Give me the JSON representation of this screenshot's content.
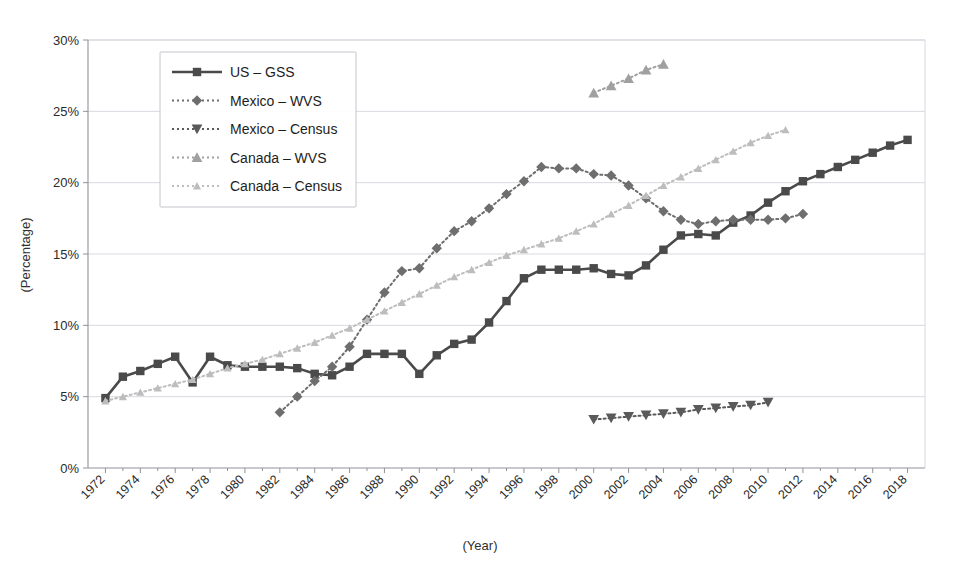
{
  "chart_data": {
    "type": "line",
    "title": "",
    "xlabel": "(Year)",
    "ylabel": "(Percentage)",
    "xlim": [
      1971,
      2019
    ],
    "ylim": [
      0,
      30
    ],
    "ytick_labels": [
      "0%",
      "5%",
      "10%",
      "15%",
      "20%",
      "25%",
      "30%"
    ],
    "ytick_values": [
      0,
      5,
      10,
      15,
      20,
      25,
      30
    ],
    "xtick_labels": [
      "1972",
      "1974",
      "1976",
      "1978",
      "1980",
      "1982",
      "1984",
      "1986",
      "1988",
      "1990",
      "1992",
      "1994",
      "1996",
      "1998",
      "2000",
      "2002",
      "2004",
      "2006",
      "2008",
      "2010",
      "2012",
      "2014",
      "2016",
      "2018"
    ],
    "xtick_values": [
      1972,
      1974,
      1976,
      1978,
      1980,
      1982,
      1984,
      1986,
      1988,
      1990,
      1992,
      1994,
      1996,
      1998,
      2000,
      2002,
      2004,
      2006,
      2008,
      2010,
      2012,
      2014,
      2016,
      2018
    ],
    "grid": true,
    "legend_position": "top-left-inside",
    "series": [
      {
        "name": "US – GSS",
        "color": "#4a4a4a",
        "marker": "square",
        "line_style": "solid",
        "x": [
          1972,
          1973,
          1974,
          1975,
          1976,
          1977,
          1978,
          1979,
          1980,
          1981,
          1982,
          1983,
          1984,
          1985,
          1986,
          1987,
          1988,
          1989,
          1990,
          1991,
          1992,
          1993,
          1994,
          1995,
          1996,
          1997,
          1998,
          1999,
          2000,
          2001,
          2002,
          2003,
          2004,
          2005,
          2006,
          2007,
          2008,
          2009,
          2010,
          2011,
          2012,
          2013,
          2014,
          2015,
          2016,
          2017,
          2018
        ],
        "y": [
          4.9,
          6.4,
          6.8,
          7.3,
          7.8,
          6.0,
          7.8,
          7.2,
          7.1,
          7.1,
          7.1,
          7.0,
          6.6,
          6.5,
          7.1,
          8.0,
          8.0,
          8.0,
          6.6,
          7.9,
          8.7,
          9.0,
          10.2,
          11.7,
          13.3,
          13.9,
          13.9,
          13.9,
          14.0,
          13.6,
          13.5,
          14.2,
          15.3,
          16.3,
          16.4,
          16.3,
          17.2,
          17.7,
          18.6,
          19.4,
          20.1,
          20.6,
          21.1,
          21.6,
          22.1,
          22.6,
          23.0
        ]
      },
      {
        "name": "Mexico – WVS",
        "color": "#6e6e6e",
        "marker": "diamond",
        "line_style": "dotted",
        "x": [
          1982,
          1983,
          1984,
          1985,
          1986,
          1987,
          1988,
          1989,
          1990,
          1991,
          1992,
          1993,
          1994,
          1995,
          1996,
          1997,
          1998,
          1999,
          2000,
          2001,
          2002,
          2003,
          2004,
          2005,
          2006,
          2007,
          2008,
          2009,
          2010,
          2011,
          2012
        ],
        "y": [
          3.9,
          5.0,
          6.1,
          7.1,
          8.5,
          10.4,
          12.3,
          13.8,
          14.0,
          15.4,
          16.6,
          17.3,
          18.2,
          19.2,
          20.1,
          21.1,
          21.0,
          21.0,
          20.6,
          20.5,
          19.8,
          18.9,
          18.0,
          17.4,
          17.1,
          17.3,
          17.4,
          17.4,
          17.4,
          17.5,
          17.8
        ]
      },
      {
        "name": "Mexico – Census",
        "color": "#5a5a5a",
        "marker": "triangle-down",
        "line_style": "dotted",
        "x": [
          2000,
          2001,
          2002,
          2003,
          2004,
          2005,
          2006,
          2007,
          2008,
          2009,
          2010
        ],
        "y": [
          3.4,
          3.5,
          3.6,
          3.7,
          3.8,
          3.9,
          4.1,
          4.2,
          4.3,
          4.4,
          4.6
        ]
      },
      {
        "name": "Canada – WVS",
        "color": "#a0a0a0",
        "marker": "triangle-up",
        "line_style": "dotted",
        "x": [
          2000,
          2001,
          2002,
          2003,
          2004
        ],
        "y": [
          26.3,
          26.8,
          27.3,
          27.9,
          28.3
        ]
      },
      {
        "name": "Canada – Census",
        "color": "#bdbdbd",
        "marker": "triangle-up-small",
        "line_style": "dotted",
        "x": [
          1972,
          1973,
          1974,
          1975,
          1976,
          1977,
          1978,
          1979,
          1980,
          1981,
          1982,
          1983,
          1984,
          1985,
          1986,
          1987,
          1988,
          1989,
          1990,
          1991,
          1992,
          1993,
          1994,
          1995,
          1996,
          1997,
          1998,
          1999,
          2000,
          2001,
          2002,
          2003,
          2004,
          2005,
          2006,
          2007,
          2008,
          2009,
          2010,
          2011
        ],
        "y": [
          4.7,
          5.0,
          5.3,
          5.6,
          5.9,
          6.2,
          6.6,
          7.0,
          7.3,
          7.6,
          8.0,
          8.4,
          8.8,
          9.3,
          9.8,
          10.4,
          11.0,
          11.6,
          12.2,
          12.8,
          13.4,
          13.9,
          14.4,
          14.9,
          15.3,
          15.7,
          16.1,
          16.6,
          17.1,
          17.8,
          18.4,
          19.1,
          19.8,
          20.4,
          21.0,
          21.6,
          22.2,
          22.8,
          23.3,
          23.7
        ]
      }
    ]
  },
  "legend": {
    "items": [
      {
        "label": "US – GSS"
      },
      {
        "label": "Mexico – WVS"
      },
      {
        "label": "Mexico – Census"
      },
      {
        "label": "Canada – WVS"
      },
      {
        "label": "Canada – Census"
      }
    ]
  }
}
